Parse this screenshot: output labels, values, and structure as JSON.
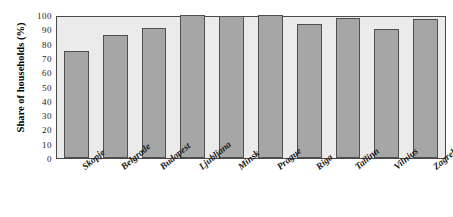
{
  "chart_data": {
    "type": "bar",
    "title": "",
    "subtitle": "",
    "xlabel": "",
    "ylabel": "Share of households (%)",
    "categories": [
      "Skopje",
      "Belgrade",
      "Budapest",
      "Ljubljana",
      "Minsk",
      "Prague",
      "Riga",
      "Tallinn",
      "Vilnius",
      "Zagreb"
    ],
    "values": [
      75,
      86,
      91,
      100,
      99,
      100,
      94,
      98,
      90,
      97
    ],
    "ylim": [
      0,
      100
    ],
    "ytick_labels": [
      "100",
      "90",
      "80",
      "70",
      "60",
      "50",
      "40",
      "30",
      "20",
      "10",
      "0"
    ],
    "ytick_values": [
      100,
      90,
      80,
      70,
      60,
      50,
      40,
      30,
      20,
      10,
      0
    ],
    "grid": false,
    "legend": "none",
    "series": [
      {
        "name": "Share of households",
        "values": [
          75,
          86,
          91,
          100,
          99,
          100,
          94,
          98,
          90,
          97
        ]
      }
    ],
    "colors": {
      "bar_fill": "#a6a6a6",
      "bar_border": "#4f4f4f",
      "plot_background": "#ebebeb",
      "axis_line": "#4a4a4a",
      "text": "#1a1a1a",
      "figure_background": "#ffffff"
    }
  }
}
